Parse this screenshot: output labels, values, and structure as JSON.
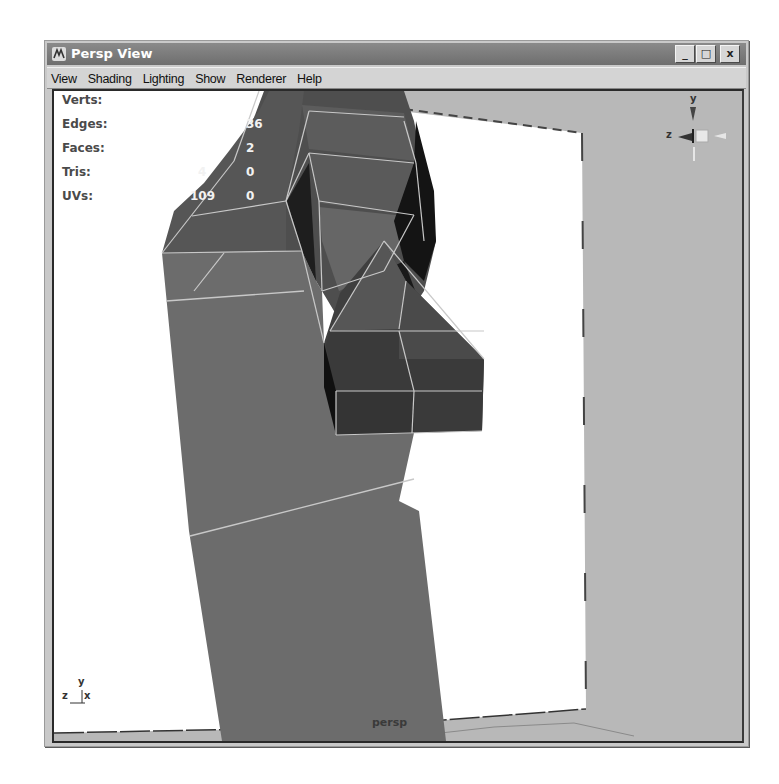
{
  "window": {
    "title": "Persp View",
    "icon": "maya-app-icon",
    "controls": {
      "minimize": "_",
      "maximize": "□",
      "close": "x"
    }
  },
  "menubar": {
    "items": [
      {
        "label": "View"
      },
      {
        "label": "Shading"
      },
      {
        "label": "Lighting"
      },
      {
        "label": "Show"
      },
      {
        "label": "Renderer"
      },
      {
        "label": "Help"
      }
    ]
  },
  "hud": {
    "rows": [
      {
        "label": "Verts:",
        "value1": "",
        "value2": ""
      },
      {
        "label": "Edges:",
        "value1": "",
        "value2": "36"
      },
      {
        "label": "Faces:",
        "value1": "",
        "value2": "2"
      },
      {
        "label": "Tris:",
        "value1": "4",
        "value2": "0"
      },
      {
        "label": "UVs:",
        "value1": "109",
        "value2": "0"
      }
    ]
  },
  "viewcube": {
    "y_label": "y",
    "z_label": "z"
  },
  "axis_gizmo": {
    "y_label": "y",
    "z_label": "z",
    "x_label": "x"
  },
  "camera": {
    "name": "persp"
  },
  "colors": {
    "viewport_bg": "#b8b8b8",
    "image_plane": "#ffffff",
    "mesh_light": "#6e6e6e",
    "mesh_mid": "#565656",
    "mesh_dark": "#3e3e3e",
    "mesh_black": "#151515",
    "wire": "#c8c8c8"
  }
}
